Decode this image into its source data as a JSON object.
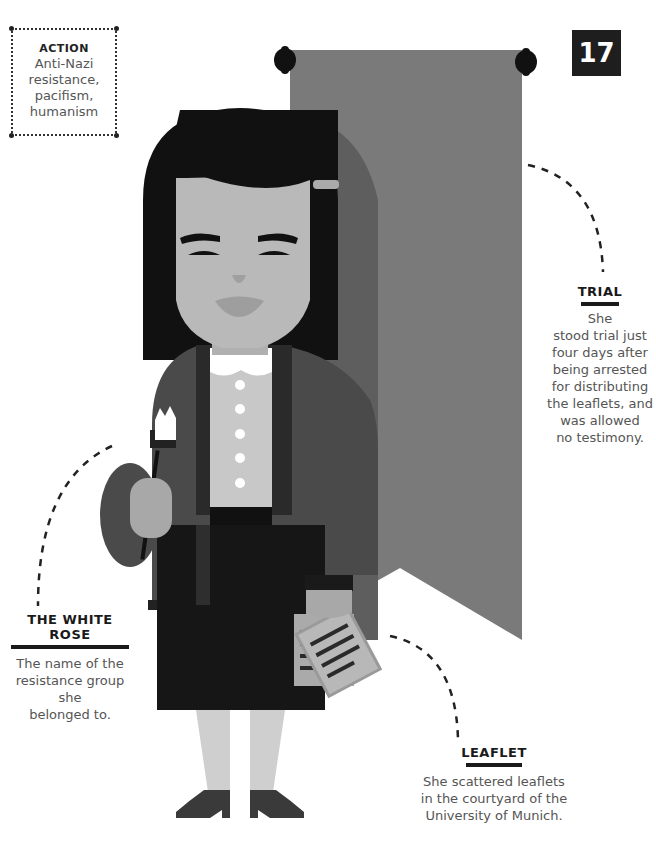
{
  "page_number": "17",
  "action": {
    "title": "ACTION",
    "lines": [
      "Anti-Nazi",
      "resistance,",
      "pacifism,",
      "humanism"
    ]
  },
  "callouts": {
    "trial": {
      "title": "TRIAL",
      "lines": [
        "She",
        "stood trial just",
        "four days after",
        "being arrested",
        "for distributing",
        "the leaflets, and",
        "was allowed",
        "no testimony."
      ]
    },
    "white_rose": {
      "title": "THE WHITE ROSE",
      "lines": [
        "The name of the",
        "resistance group she",
        "belonged to."
      ]
    },
    "leaflet": {
      "title": "LEAFLET",
      "lines": [
        "She scattered leaflets",
        "in the courtyard of the",
        "University of Munich."
      ]
    }
  },
  "colors": {
    "banner": "#7a7a7a",
    "banner_shadow": "#5e5e5e",
    "hair": "#111111",
    "skin": "#b9b9b9",
    "jacket": "#4a4a4a",
    "skirt": "#161616",
    "shirt": "#c8c8c8",
    "badge_bg": "#1e1e1e"
  }
}
